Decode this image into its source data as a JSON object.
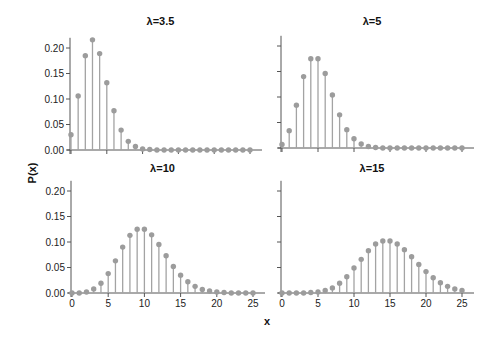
{
  "figure": {
    "xlabel": "x",
    "ylabel": "P(x)"
  },
  "colors": {
    "stem": "#a3a3a3",
    "marker": "#9c9c9c",
    "axis": "#555555"
  },
  "chart_data": [
    {
      "type": "stem",
      "title": "λ=3.5",
      "xlabel": "x",
      "ylabel": "P(x)",
      "x": [
        0,
        1,
        2,
        3,
        4,
        5,
        6,
        7,
        8,
        9,
        10,
        11,
        12,
        13,
        14,
        15,
        16,
        17,
        18,
        19,
        20,
        21,
        22,
        23,
        24,
        25
      ],
      "values": [
        0.03,
        0.106,
        0.185,
        0.216,
        0.189,
        0.132,
        0.077,
        0.039,
        0.017,
        0.007,
        0.002,
        0.001,
        0.0,
        0.0,
        0.0,
        0.0,
        0.0,
        0.0,
        0.0,
        0.0,
        0.0,
        0.0,
        0.0,
        0.0,
        0.0,
        0.0
      ],
      "xticks": [
        0,
        5,
        10,
        15,
        20,
        25
      ],
      "yticks": [
        "0.00",
        "0.05",
        "0.10",
        "0.15",
        "0.20"
      ],
      "xlim": [
        0,
        25
      ],
      "ylim": [
        0,
        0.22
      ],
      "grid": false
    },
    {
      "type": "stem",
      "title": "λ=5",
      "xlabel": "x",
      "ylabel": "P(x)",
      "x": [
        0,
        1,
        2,
        3,
        4,
        5,
        6,
        7,
        8,
        9,
        10,
        11,
        12,
        13,
        14,
        15,
        16,
        17,
        18,
        19,
        20,
        21,
        22,
        23,
        24,
        25
      ],
      "values": [
        0.007,
        0.034,
        0.084,
        0.14,
        0.175,
        0.175,
        0.146,
        0.104,
        0.065,
        0.036,
        0.018,
        0.008,
        0.003,
        0.001,
        0.0,
        0.0,
        0.0,
        0.0,
        0.0,
        0.0,
        0.0,
        0.0,
        0.0,
        0.0,
        0.0,
        0.0
      ],
      "xticks": [
        0,
        5,
        10,
        15,
        20,
        25
      ],
      "yticks": [
        "0.00",
        "0.05",
        "0.10",
        "0.15",
        "0.20"
      ],
      "xlim": [
        0,
        25
      ],
      "ylim": [
        0,
        0.22
      ],
      "grid": false
    },
    {
      "type": "stem",
      "title": "λ=10",
      "xlabel": "x",
      "ylabel": "P(x)",
      "x": [
        0,
        1,
        2,
        3,
        4,
        5,
        6,
        7,
        8,
        9,
        10,
        11,
        12,
        13,
        14,
        15,
        16,
        17,
        18,
        19,
        20,
        21,
        22,
        23,
        24,
        25
      ],
      "values": [
        0.0,
        0.0,
        0.002,
        0.008,
        0.019,
        0.038,
        0.063,
        0.09,
        0.113,
        0.125,
        0.125,
        0.114,
        0.095,
        0.073,
        0.052,
        0.035,
        0.022,
        0.013,
        0.007,
        0.004,
        0.002,
        0.001,
        0.0,
        0.0,
        0.0,
        0.0
      ],
      "xticks": [
        0,
        5,
        10,
        15,
        20,
        25
      ],
      "yticks": [
        "0.00",
        "0.05",
        "0.10",
        "0.15",
        "0.20"
      ],
      "xlim": [
        0,
        25
      ],
      "ylim": [
        0,
        0.22
      ],
      "grid": false
    },
    {
      "type": "stem",
      "title": "λ=15",
      "xlabel": "x",
      "ylabel": "P(x)",
      "x": [
        0,
        1,
        2,
        3,
        4,
        5,
        6,
        7,
        8,
        9,
        10,
        11,
        12,
        13,
        14,
        15,
        16,
        17,
        18,
        19,
        20,
        21,
        22,
        23,
        24,
        25
      ],
      "values": [
        0.0,
        0.0,
        0.0,
        0.0,
        0.001,
        0.002,
        0.005,
        0.01,
        0.019,
        0.032,
        0.049,
        0.066,
        0.083,
        0.096,
        0.102,
        0.102,
        0.096,
        0.085,
        0.071,
        0.056,
        0.042,
        0.03,
        0.02,
        0.013,
        0.008,
        0.005
      ],
      "xticks": [
        0,
        5,
        10,
        15,
        20,
        25
      ],
      "yticks": [
        "0.00",
        "0.05",
        "0.10",
        "0.15",
        "0.20"
      ],
      "xlim": [
        0,
        25
      ],
      "ylim": [
        0,
        0.22
      ],
      "grid": false
    }
  ]
}
